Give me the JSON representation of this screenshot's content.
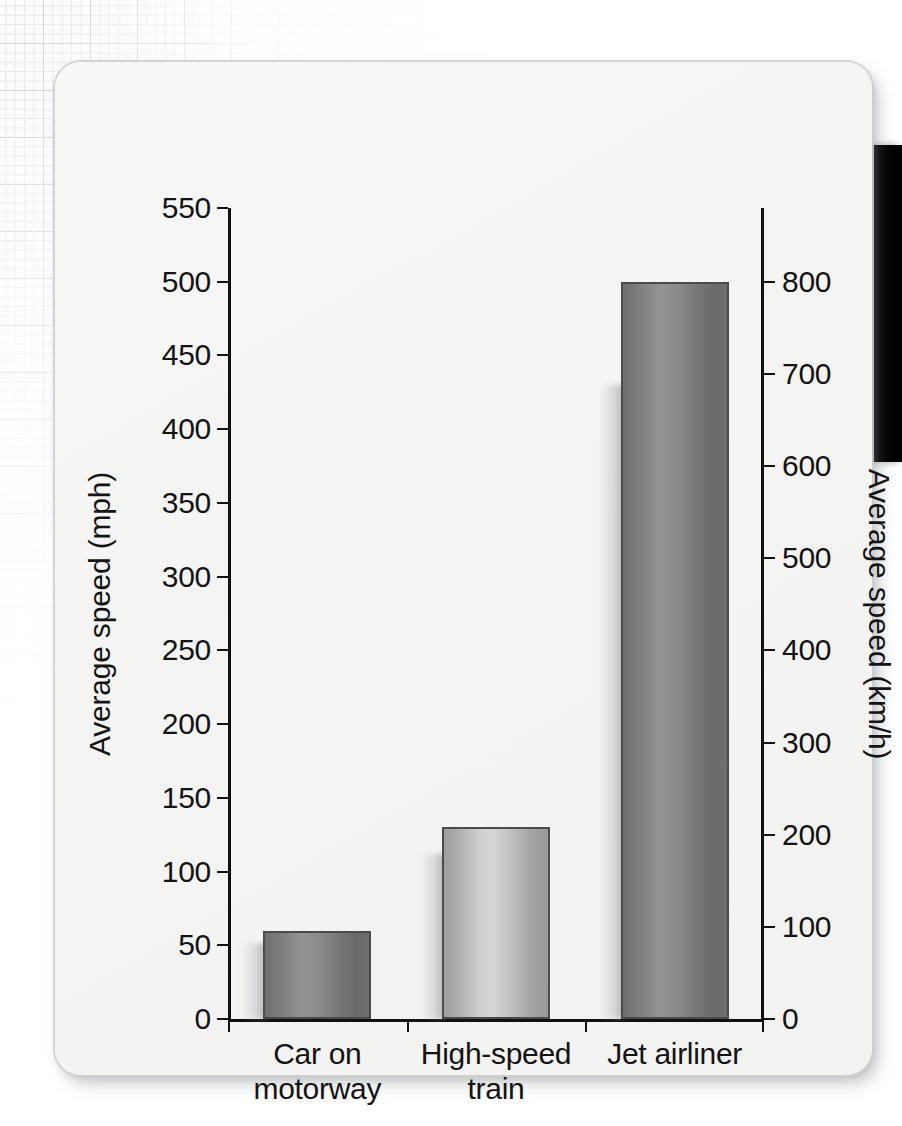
{
  "figure": {
    "card_background": "#f4f4f3",
    "axis_color": "#111111",
    "edge_block_color": "#000000"
  },
  "chart_data": {
    "type": "bar",
    "title": "",
    "categories": [
      "Car on\nmotorway",
      "High-speed\ntrain",
      "Jet airliner"
    ],
    "category_lines": [
      [
        "Car on",
        "motorway"
      ],
      [
        "High-speed",
        "train"
      ],
      [
        "Jet airliner",
        ""
      ]
    ],
    "series": [
      {
        "name": "Average speed (mph)",
        "unit": "mph",
        "values": [
          60,
          130,
          500
        ]
      },
      {
        "name": "Average speed (km/h)",
        "unit": "km/h",
        "values": [
          97,
          209,
          800
        ]
      }
    ],
    "values": [
      60,
      130,
      500
    ],
    "bar_styles": [
      "dark",
      "light",
      "dark"
    ],
    "xlabel": "",
    "ylabel": "Average speed (mph)",
    "ylabel_right": "Average speed (km/h)",
    "ylim": [
      0,
      550
    ],
    "ylim_right": [
      0,
      880
    ],
    "yticks_left": [
      0,
      50,
      100,
      150,
      200,
      250,
      300,
      350,
      400,
      450,
      500,
      550
    ],
    "ytick_labels_left": [
      "0",
      "50",
      "100",
      "150",
      "200",
      "250",
      "300",
      "350",
      "400",
      "450",
      "500",
      "550"
    ],
    "yticks_right": [
      0,
      100,
      200,
      300,
      400,
      500,
      600,
      700,
      800
    ],
    "ytick_labels_right": [
      "0",
      "100",
      "200",
      "300",
      "400",
      "500",
      "600",
      "700",
      "800"
    ],
    "grid": false,
    "legend": "none"
  }
}
